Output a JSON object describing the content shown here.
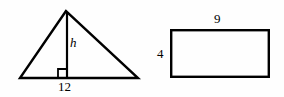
{
  "figure": {
    "background_color": "#fefefe",
    "stroke_color": "#000000",
    "shapes": {
      "triangle": {
        "name": "triangle",
        "base_label": "12",
        "height_label": "h",
        "has_right_angle_marker": true,
        "apex": {
          "x": 66,
          "y": 11
        },
        "left_vertex": {
          "x": 20,
          "y": 78
        },
        "right_vertex": {
          "x": 138,
          "y": 78
        },
        "altitude_foot": {
          "x": 67,
          "y": 78
        },
        "stroke_width": 2.4,
        "right_angle_marker_size": 9
      },
      "rectangle": {
        "name": "rectangle",
        "width_label": "9",
        "height_label": "4",
        "x": 170,
        "y": 29,
        "width": 100,
        "height": 49,
        "stroke_width": 2.4
      }
    }
  }
}
